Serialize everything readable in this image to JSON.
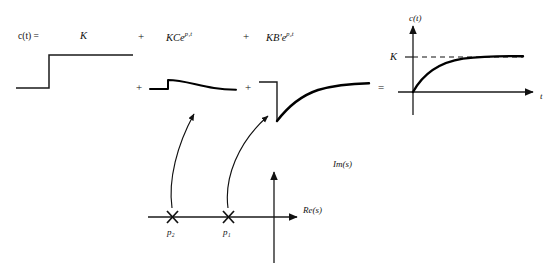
{
  "figure": {
    "type": "control-systems-partial-fraction-diagram",
    "equation_label": "c(t) =",
    "operators": {
      "plus_top_1": "+",
      "plus_top_2": "+",
      "plus_row_1": "+",
      "plus_row_2": "+",
      "equals_row": "="
    },
    "terms": [
      {
        "id": "term-constant",
        "text": "K",
        "base": "K",
        "coefficient": "",
        "exponent": ""
      },
      {
        "id": "term-mode-1",
        "text": "KCe",
        "base": "KCe",
        "exponent": "p₁t"
      },
      {
        "id": "term-mode-2",
        "text": "KB'e",
        "base": "KB'e",
        "exponent": "p₂t"
      }
    ],
    "waveforms": [
      {
        "id": "step-response",
        "name": "unit-step",
        "description": "step from 0 to K"
      },
      {
        "id": "mode-1-response",
        "name": "fast-decaying-exponential",
        "description": "positive jump decaying to zero"
      },
      {
        "id": "mode-2-response",
        "name": "slow-rising-exponential",
        "description": "negative jump rising to zero"
      },
      {
        "id": "total-response",
        "name": "first-order-step-response",
        "description": "rises exponentially to K"
      }
    ],
    "result_plot": {
      "y_axis_label": "c(t)",
      "x_axis_label": "t",
      "asymptote_label": "K",
      "asymptote_style": "dashed"
    },
    "splane": {
      "imag_axis_label": "Im(s)",
      "real_axis_label": "Re(s)",
      "poles": [
        {
          "id": "pole-p2",
          "label": "p₂",
          "marker": "x",
          "position": "far-left-real-axis"
        },
        {
          "id": "pole-p1",
          "label": "p₁",
          "marker": "x",
          "position": "near-left-real-axis"
        }
      ],
      "mapping_arrows": [
        {
          "id": "arrow-p2-to-mode",
          "from": "pole-p2",
          "to": "mode-1-response"
        },
        {
          "id": "arrow-p1-to-mode",
          "from": "pole-p1",
          "to": "mode-2-response"
        }
      ]
    },
    "colors": {
      "ink": "#111111",
      "axis": "#1a1a1a",
      "curve": "#000000",
      "background": "#ffffff"
    }
  }
}
